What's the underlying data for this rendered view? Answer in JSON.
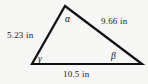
{
  "figure": {
    "type": "triangle-diagram",
    "background_color": "#f7f7f5",
    "stroke_color": "#111111",
    "text_color": "#1a1a1a",
    "unit": "in",
    "sides": [
      {
        "name": "left-side",
        "label": "5.23 in",
        "value": 5.23
      },
      {
        "name": "right-side",
        "label": "9.66 in",
        "value": 9.66
      },
      {
        "name": "bottom-side",
        "label": "10.5 in",
        "value": 10.5
      }
    ],
    "angles": [
      {
        "name": "alpha",
        "label": "α"
      },
      {
        "name": "beta",
        "label": "β"
      },
      {
        "name": "gamma",
        "label": "γ"
      }
    ],
    "vertices": {
      "apex": {
        "x": 65,
        "y": 6
      },
      "bottom_left": {
        "x": 32,
        "y": 64
      },
      "bottom_right": {
        "x": 142,
        "y": 64
      }
    }
  }
}
